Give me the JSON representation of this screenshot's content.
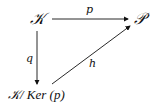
{
  "diagram": {
    "type": "commutative-diagram",
    "nodes": {
      "top_left": "𝒦",
      "top_right": "𝒫",
      "bottom_left": "𝒦/ Ker (p)"
    },
    "arrows": [
      {
        "from": "top_left",
        "to": "top_right",
        "label": "p"
      },
      {
        "from": "top_left",
        "to": "bottom_left",
        "label": "q"
      },
      {
        "from": "bottom_left",
        "to": "top_right",
        "label": "h"
      }
    ]
  }
}
